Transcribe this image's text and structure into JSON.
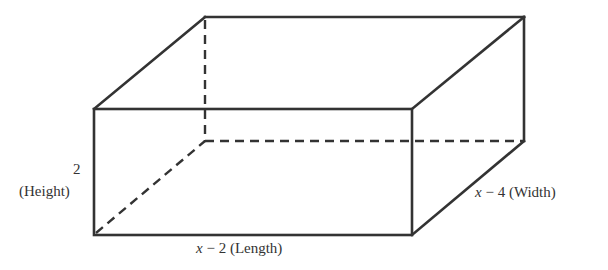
{
  "figure": {
    "type": "rectangular box (3D)",
    "line_color": "#333333",
    "vertices": {
      "front_top_left": [
        94,
        109
      ],
      "front_top_right": [
        412,
        109
      ],
      "front_bottom_left": [
        94,
        235
      ],
      "front_bottom_right": [
        412,
        235
      ],
      "back_top_left": [
        205,
        17
      ],
      "back_top_right": [
        524,
        17
      ],
      "back_bottom_right": [
        524,
        141
      ],
      "back_bottom_left_hidden": [
        205,
        141
      ]
    }
  },
  "labels": {
    "height_value": "2",
    "height_name": "(Height)",
    "length_var": "x",
    "length_expr": " − 2 ",
    "length_name": "(Length)",
    "width_var": "x",
    "width_expr": " − 4 ",
    "width_name": "(Width)"
  }
}
